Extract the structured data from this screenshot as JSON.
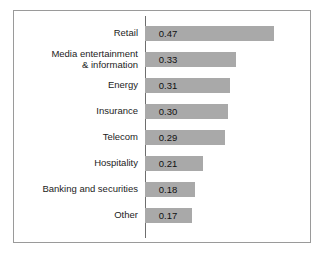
{
  "chart_data": {
    "type": "bar",
    "orientation": "horizontal",
    "title": "",
    "subtitle": "",
    "xlabel": "",
    "ylabel": "",
    "xlim": [
      0,
      0.5
    ],
    "grid": false,
    "legend": false,
    "axis_ticks": [],
    "value_labels_shown": true,
    "categories": [
      "Retail",
      "Media entertainment\n& information",
      "Energy",
      "Insurance",
      "Telecom",
      "Hospitality",
      "Banking and securities",
      "Other"
    ],
    "values": [
      0.47,
      0.33,
      0.31,
      0.3,
      0.29,
      0.21,
      0.18,
      0.17
    ],
    "value_labels": [
      "0.47",
      "0.33",
      "0.31",
      "0.30",
      "0.29",
      "0.21",
      "0.18",
      "0.17"
    ],
    "colors": {
      "bar_fill": "#a9a9a9",
      "axis_line": "#6e6e6e",
      "frame_border": "#9a9a9a",
      "background": "#ffffff",
      "label_text": "#1c1c1c"
    },
    "scale_px_per_unit": 275
  }
}
